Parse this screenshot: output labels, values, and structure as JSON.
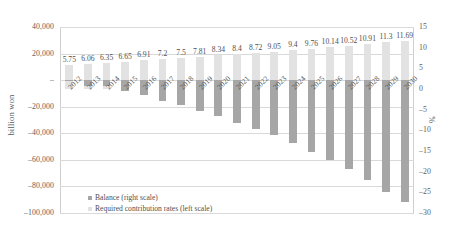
{
  "chart_data": {
    "type": "bar",
    "title": "",
    "xlabel": "",
    "ylabel": "billion won",
    "y2label": "%",
    "grid": true,
    "legend_position": "inside-bottom-left",
    "categories": [
      "2012",
      "2013",
      "2014",
      "2015",
      "2016",
      "2017",
      "2018",
      "2019",
      "2020",
      "2021",
      "2022",
      "2023",
      "2024",
      "2025",
      "2026",
      "2027",
      "2028",
      "2029",
      "2030"
    ],
    "ylim": [
      -100000,
      40000
    ],
    "y2lim": [
      -30,
      15
    ],
    "yticks": [
      "40,000",
      "20,000",
      "–",
      "–20,000",
      "–40,000",
      "–60,000",
      "–80,000",
      "–100,000"
    ],
    "ytick_values": [
      40000,
      20000,
      0,
      -20000,
      -40000,
      -60000,
      -80000,
      -100000
    ],
    "y2ticks": [
      "15",
      "10",
      "5",
      "0",
      "–5",
      "–10",
      "–15",
      "–20",
      "–25",
      "–30"
    ],
    "y2tick_values": [
      15,
      10,
      5,
      0,
      -5,
      -10,
      -15,
      -20,
      -25,
      -30
    ],
    "series": [
      {
        "name": "Required contribution rates (left scale)",
        "axis": "left",
        "color": "#e2e2e2",
        "unit": "%",
        "values": [
          5.75,
          6.06,
          6.35,
          6.65,
          6.91,
          7.2,
          7.5,
          7.81,
          8.34,
          8.4,
          8.72,
          9.05,
          9.4,
          9.76,
          10.14,
          10.52,
          10.91,
          11.3,
          11.69
        ],
        "labels": [
          "5.75",
          "6.06",
          "6.35",
          "6.65",
          "6.91",
          "7.2",
          "7.5",
          "7.81",
          "8.34",
          "8.4",
          "8.72",
          "9.05",
          "9.4",
          "9.76",
          "10.14",
          "10.52",
          "10.91",
          "11.3",
          "11.69"
        ]
      },
      {
        "name": "Balance (right scale)",
        "axis": "right",
        "color": "#a6a6a6",
        "unit": "billion won",
        "values": [
          -400,
          -4200,
          -4300,
          -8200,
          -11500,
          -15500,
          -19000,
          -23500,
          -27000,
          -32000,
          -36500,
          -41500,
          -47500,
          -54000,
          -60000,
          -67000,
          -75500,
          -84500,
          -92000
        ]
      }
    ],
    "legend": [
      {
        "label": "Balance (right scale)",
        "color": "#a6a6a6"
      },
      {
        "label": "Required contribution rates (left scale)",
        "color": "#e2e2e2"
      }
    ]
  }
}
